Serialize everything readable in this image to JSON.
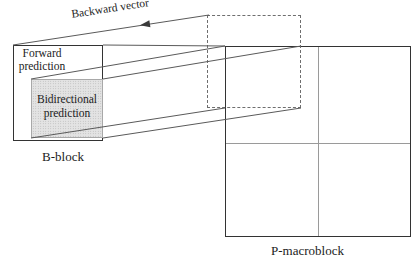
{
  "diagram": {
    "title_context": "B-block bidirectional prediction onto P-macroblock",
    "labels": {
      "backward_vector": "Backward vector",
      "forward_prediction": {
        "line1": "Forward",
        "line2": "prediction"
      },
      "bidirectional_prediction": {
        "line1": "Bidirectional",
        "line2": "prediction"
      },
      "b_block": "B-block",
      "p_macroblock": "P-macroblock"
    },
    "colors": {
      "line": "#5a5a5a",
      "border_dark": "#333333",
      "dashed": "#6e6e6e",
      "midline": "#9a9a9a",
      "shade_fill": "#e3e3e3",
      "shade_dot": "#b2b2b2",
      "text": "#1b1b1b",
      "background": "#ffffff"
    }
  }
}
